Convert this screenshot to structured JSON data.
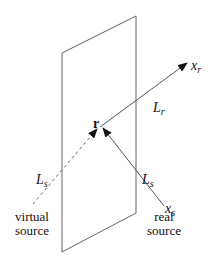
{
  "diagram": {
    "labels": {
      "r": "r",
      "x_r": "x",
      "x_r_sub": "r",
      "L_r": "L",
      "L_r_sub": "r",
      "L_s_left": "L",
      "L_s_left_sub": "s",
      "L_s_right": "L",
      "L_s_right_sub": "s",
      "x_s": "x",
      "x_s_sub": "s",
      "virtual_line1": "virtual",
      "virtual_line2": "source",
      "real_line1": "real",
      "real_line2": "source"
    },
    "colors": {
      "stroke": "#555555",
      "text": "#111111"
    }
  }
}
